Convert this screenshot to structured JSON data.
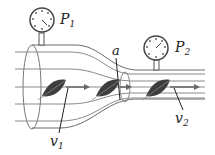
{
  "diagram": {
    "type": "venturi-tube-bernoulli",
    "labels": {
      "p1": {
        "main": "P",
        "sub": "1"
      },
      "p2": {
        "main": "P",
        "sub": "2"
      },
      "a": {
        "main": "a"
      },
      "v1": {
        "main": "v",
        "sub": "1"
      },
      "v2": {
        "main": "v",
        "sub": "2"
      }
    },
    "colors": {
      "stroke": "#555555",
      "flowline": "#7a7a7a",
      "leaf": "#3a3a3a",
      "arrow": "#666666"
    }
  }
}
